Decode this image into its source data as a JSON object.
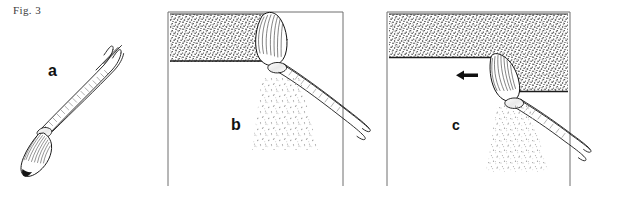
{
  "figure": {
    "caption": "Fig. 3",
    "medium": "pen-and-ink line drawing",
    "panels": [
      {
        "id": "a",
        "label": "a",
        "description": "Isolated paintbrush shown diagonally, bristle tip lower-left, handle upper-right",
        "has_frame": false,
        "has_arrow": false,
        "has_stipple_field": false
      },
      {
        "id": "b",
        "label": "b",
        "description": "Brush pressed against a stippled mass at the upper-left, bristles splayed upward, paint spray falling below; stroke moving right",
        "has_frame": true,
        "has_arrow": true,
        "arrow_direction": "right",
        "arrow_glyph": "→",
        "has_stipple_field": true
      },
      {
        "id": "c",
        "label": "c",
        "description": "Brush pressed against a stippled mass occupying the upper band, bristles bent down at a notch, paint spray falling below; stroke moving left",
        "has_frame": true,
        "has_arrow": true,
        "arrow_direction": "left",
        "arrow_glyph": "←",
        "has_stipple_field": true
      }
    ]
  },
  "colors": {
    "background": "#ffffff",
    "ink": "#111111",
    "frame_line": "#6f6f6f",
    "caption_text": "#3b3b3b",
    "stipple": "#2a2a2a",
    "spray": "#9a9a9a"
  },
  "icons": {
    "arrow_right": "arrow-right-icon",
    "arrow_left": "arrow-left-icon"
  }
}
